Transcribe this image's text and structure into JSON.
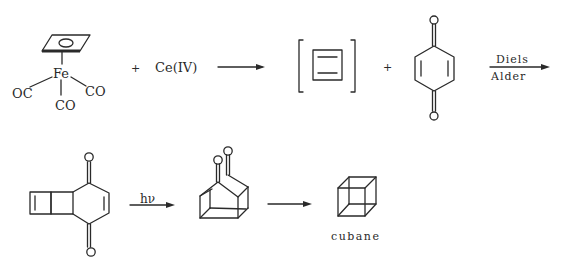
{
  "row1": {
    "complex": {
      "metal": "Fe",
      "ligands": [
        "OC",
        "CO",
        "CO"
      ],
      "ring": "cyclobutadiene (η4)"
    },
    "plus1": "+",
    "reagent": "Ce(IV)",
    "intermediate": "cyclobutadiene (in brackets)",
    "plus2": "+",
    "dienophile": "p-benzoquinone",
    "arrow_label_top": "Diels",
    "arrow_label_bottom": "Alder"
  },
  "row2": {
    "adduct": "Diels-Alder adduct (tricyclic dione)",
    "arrow_label": "hν",
    "cage": "cage diketone",
    "product": "cubane",
    "product_label": "cubane"
  },
  "atoms": {
    "oxygen": "O"
  },
  "colors": {
    "ink": "#2a2a2a",
    "background": "#ffffff"
  }
}
